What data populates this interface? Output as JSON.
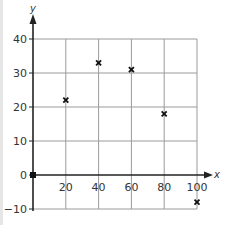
{
  "chart_data": {
    "type": "scatter",
    "title": "",
    "xlabel": "x",
    "ylabel": "y",
    "xlim": [
      0,
      100
    ],
    "ylim": [
      -10,
      40
    ],
    "grid": true,
    "x_ticks": [
      "20",
      "40",
      "60",
      "80",
      "100"
    ],
    "y_ticks": [
      "40",
      "30",
      "20",
      "10",
      "0",
      "−10"
    ],
    "marker": "x",
    "points": [
      {
        "x": 0,
        "y": 0
      },
      {
        "x": 20,
        "y": 22
      },
      {
        "x": 40,
        "y": 33
      },
      {
        "x": 60,
        "y": 31
      },
      {
        "x": 80,
        "y": 18
      },
      {
        "x": 100,
        "y": -8
      }
    ],
    "colors": {
      "axis": "#222222",
      "grid": "#9a9a9a",
      "marker": "#111111"
    }
  }
}
